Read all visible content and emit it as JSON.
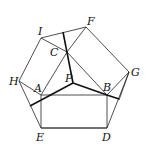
{
  "diagram": {
    "type": "geometry-figure",
    "labels": {
      "I": "I",
      "F": "F",
      "C": "C",
      "G": "G",
      "H": "H",
      "A": "A",
      "P": "P",
      "B": "B",
      "E": "E",
      "D": "D"
    },
    "points": {
      "I": [
        41,
        38
      ],
      "F": [
        86,
        27
      ],
      "G": [
        129,
        72
      ],
      "D": [
        107,
        128
      ],
      "E": [
        41,
        128
      ],
      "H": [
        19,
        81
      ],
      "A": [
        41,
        95
      ],
      "B": [
        107,
        95
      ],
      "C": [
        67,
        52
      ],
      "P": [
        73,
        83
      ]
    },
    "colors": {
      "line": "#222222",
      "background": "#ffffff"
    }
  }
}
